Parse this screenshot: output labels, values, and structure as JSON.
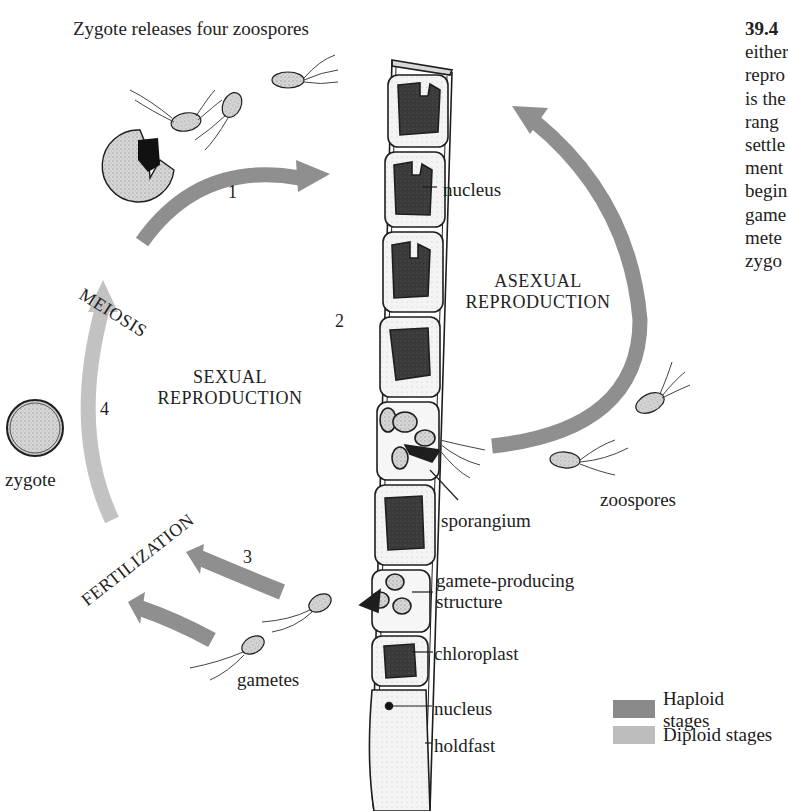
{
  "diagram": {
    "title": "Zygote releases four zoospores",
    "caption": {
      "figure_number": "39.4",
      "lines": [
        "either",
        "repro",
        "is the",
        "rang",
        "settle",
        "ment",
        "begin",
        "game",
        "mete",
        "zygo"
      ]
    },
    "cycle_labels": {
      "meiosis": "MEIOSIS",
      "fertilization": "FERTILIZATION",
      "sexual": [
        "SEXUAL",
        "REPRODUCTION"
      ],
      "asexual": [
        "ASEXUAL",
        "REPRODUCTION"
      ]
    },
    "step_numbers": [
      "1",
      "2",
      "3",
      "4"
    ],
    "part_labels": {
      "nucleus_top": "nucleus",
      "sporangium": "sporangium",
      "zoospores": "zoospores",
      "zygote": "zygote",
      "gametes": "gametes",
      "gamete_structure": [
        "gamete-producing",
        "structure"
      ],
      "chloroplast": "chloroplast",
      "nucleus_bottom": "nucleus",
      "holdfast": "holdfast"
    },
    "legend": {
      "items": [
        {
          "label": "Haploid stages",
          "color": "#8a8a8a"
        },
        {
          "label": "Diploid stages",
          "color": "#bdbdbd"
        }
      ]
    },
    "colors": {
      "haploid_arrow": "#8f8f8f",
      "diploid_arrow": "#c2c2c2",
      "chloroplast": "#3a3a3a",
      "cell_fill": "#f2f2f2",
      "outline": "#1e1e1e"
    }
  }
}
